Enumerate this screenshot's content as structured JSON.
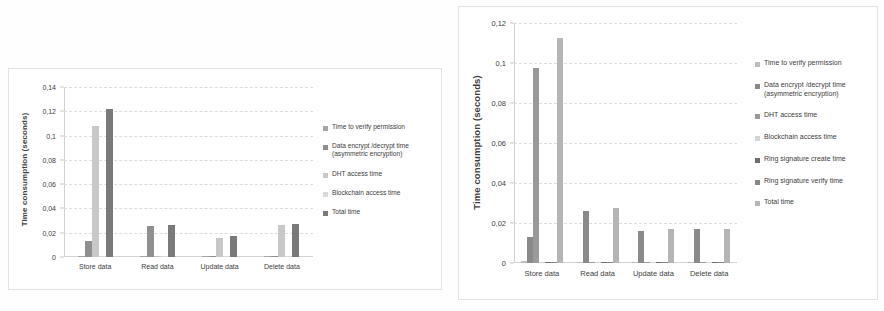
{
  "figure": {
    "background": "#ffffff",
    "charts": [
      {
        "id": "left",
        "ylabel": "Time consumption (seconds)",
        "yticks": [
          "0,14",
          "0,12",
          "0,1",
          "0,08",
          "0,06",
          "0,04",
          "0,02",
          "0"
        ],
        "categories": [
          "Store data",
          "Read data",
          "Update data",
          "Delete data"
        ]
      },
      {
        "id": "right",
        "ylabel": "Time consumption (seconds)",
        "yticks": [
          "0,12",
          "0,1",
          "0,08",
          "0,06",
          "0,04",
          "0,02",
          "0"
        ],
        "categories": [
          "Store data",
          "Read data",
          "Update data",
          "Delete data"
        ]
      }
    ]
  },
  "chart_data": [
    {
      "type": "bar",
      "id": "left-chart",
      "title": "",
      "xlabel": "",
      "ylabel": "Time consumption (seconds)",
      "ylim": [
        0,
        0.14
      ],
      "ytick_values": [
        0,
        0.02,
        0.04,
        0.06,
        0.08,
        0.1,
        0.12,
        0.14
      ],
      "ytick_labels": [
        "0",
        "0,02",
        "0,04",
        "0,06",
        "0,08",
        "0,1",
        "0,12",
        "0,14"
      ],
      "grid": true,
      "legend_position": "right",
      "categories": [
        "Store data",
        "Read data",
        "Update data",
        "Delete data"
      ],
      "series": [
        {
          "name": "Time to verify permission",
          "color": "#a6a6a6",
          "values": [
            0.0004,
            0.0003,
            0.0004,
            0.0003
          ]
        },
        {
          "name": "Data encrypt /decrypt time (asymmetric encryption)",
          "color": "#8f8f8f",
          "values": [
            0.0128,
            0.0258,
            0.0005,
            0.0003
          ]
        },
        {
          "name": "DHT access time",
          "color": "#c8c8c8",
          "values": [
            0.1082,
            0.0002,
            0.0155,
            0.0265
          ]
        },
        {
          "name": "Blockchain access time",
          "color": "#d9d9d9",
          "values": [
            0.0002,
            0.0002,
            0.0002,
            0.0002
          ]
        },
        {
          "name": "Total time",
          "color": "#7a7a7a",
          "values": [
            0.1222,
            0.0266,
            0.0172,
            0.0271
          ]
        }
      ]
    },
    {
      "type": "bar",
      "id": "right-chart",
      "title": "",
      "xlabel": "",
      "ylabel": "Time consumption (seconds)",
      "ylim": [
        0,
        0.12
      ],
      "ytick_values": [
        0,
        0.02,
        0.04,
        0.06,
        0.08,
        0.1,
        0.12
      ],
      "ytick_labels": [
        "0",
        "0,02",
        "0,04",
        "0,06",
        "0,08",
        "0,1",
        "0,12"
      ],
      "grid": true,
      "legend_position": "right",
      "categories": [
        "Store data",
        "Read data",
        "Update data",
        "Delete data"
      ],
      "series": [
        {
          "name": "Time to verify permission",
          "color": "#bdbdbd",
          "values": [
            0.0009,
            0.0004,
            0.0004,
            0.0003
          ]
        },
        {
          "name": "Data encrypt /decrypt time (asymmetric encryption)",
          "color": "#8a8a8a",
          "values": [
            0.0131,
            0.0259,
            0.0159,
            0.0169
          ]
        },
        {
          "name": "DHT access time",
          "color": "#9a9a9a",
          "values": [
            0.0977,
            0.0006,
            0.0003,
            0.0003
          ]
        },
        {
          "name": "Blockchain access time",
          "color": "#d4d4d4",
          "values": [
            0.0003,
            0.0005,
            0.0003,
            0.0003
          ]
        },
        {
          "name": "Ring signature create time",
          "color": "#6e6e6e",
          "values": [
            0.0002,
            0.0002,
            0.0002,
            0.0002
          ]
        },
        {
          "name": "Ring signature verify time",
          "color": "#878787",
          "values": [
            0.0002,
            0.0002,
            0.0002,
            0.0002
          ]
        },
        {
          "name": "Total time",
          "color": "#b5b5b5",
          "values": [
            0.1124,
            0.0276,
            0.017,
            0.017
          ]
        }
      ]
    }
  ],
  "legends": {
    "left": [
      {
        "label": "Time to verify permission",
        "sub": "",
        "color": "#a6a6a6"
      },
      {
        "label": "Data encrypt /decrypt time",
        "sub": "(asymmetric encryption)",
        "color": "#8f8f8f"
      },
      {
        "label": " DHT access time",
        "sub": "",
        "color": "#c8c8c8"
      },
      {
        "label": "Blockchain access time",
        "sub": "",
        "color": "#d9d9d9"
      },
      {
        "label": "Total time",
        "sub": "",
        "color": "#7a7a7a"
      }
    ],
    "right": [
      {
        "label": "Time to verify permission",
        "sub": "",
        "color": "#bdbdbd"
      },
      {
        "label": "Data encrypt /decrypt time",
        "sub": "(asymmetric encryption)",
        "color": "#8a8a8a"
      },
      {
        "label": " DHT access time",
        "sub": "",
        "color": "#9a9a9a"
      },
      {
        "label": "Blockchain access time",
        "sub": "",
        "color": "#d4d4d4"
      },
      {
        "label": "Ring signature create time",
        "sub": "",
        "color": "#6e6e6e"
      },
      {
        "label": "Ring signature verify time",
        "sub": "",
        "color": "#878787"
      },
      {
        "label": "Total time",
        "sub": "",
        "color": "#b5b5b5"
      }
    ]
  }
}
